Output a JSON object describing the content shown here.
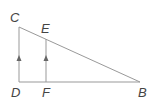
{
  "diagram": {
    "type": "geometry",
    "colors": {
      "line": "#999999",
      "arrow": "#666666",
      "label": "#444444"
    },
    "points": {
      "C": {
        "label": "C",
        "x": 19,
        "y": 27
      },
      "E": {
        "label": "E",
        "x": 46,
        "y": 38
      },
      "D": {
        "label": "D",
        "x": 19,
        "y": 82
      },
      "F": {
        "label": "F",
        "x": 46,
        "y": 82
      },
      "B": {
        "label": "B",
        "x": 140,
        "y": 82
      }
    },
    "segments": [
      "CD",
      "DB",
      "CB",
      "EF"
    ],
    "parallel_marks": [
      "CD",
      "EF"
    ]
  }
}
